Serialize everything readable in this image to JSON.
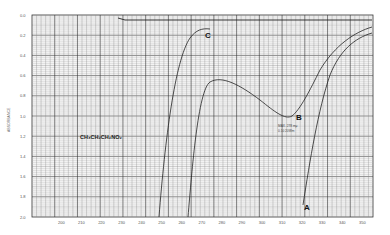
{
  "chart_data": {
    "type": "line",
    "title": "",
    "xlabel": "Wavelength (mμ)",
    "ylabel": "Absorbance",
    "y_axis_direction": "increasing downward",
    "xlim": [
      195,
      350
    ],
    "ylim": [
      0.0,
      2.0
    ],
    "grid": true,
    "y_ticks": [
      "0.0",
      "0.2",
      "0.4",
      "0.6",
      "0.8",
      "1.0",
      "1.2",
      "1.4",
      "1.6",
      "1.8",
      "2.0"
    ],
    "x_ticks": [
      "200",
      "210",
      "220",
      "230",
      "240",
      "250",
      "260",
      "270",
      "280",
      "290",
      "300",
      "310",
      "320",
      "330",
      "340",
      "350"
    ],
    "annotations": [
      {
        "text": "CH3CH2CH2NO2",
        "kind": "compound-formula"
      },
      {
        "text": "MAX. 278 mμ",
        "kind": "peak-note"
      },
      {
        "text": "0.10  ...",
        "kind": "peak-note"
      }
    ],
    "series": [
      {
        "name": "C",
        "points": [
          [
            230,
            2.0
          ],
          [
            233,
            1.2
          ],
          [
            236,
            0.6
          ],
          [
            240,
            0.2
          ],
          [
            244,
            0.1
          ]
        ]
      },
      {
        "name": "B",
        "points": [
          [
            245,
            2.0
          ],
          [
            247,
            1.2
          ],
          [
            250,
            0.75
          ],
          [
            255,
            0.6
          ],
          [
            265,
            0.75
          ],
          [
            272,
            0.95
          ],
          [
            278,
            1.0
          ],
          [
            285,
            0.85
          ],
          [
            295,
            0.5
          ],
          [
            310,
            0.25
          ],
          [
            330,
            0.1
          ],
          [
            345,
            0.05
          ]
        ]
      },
      {
        "name": "A",
        "points": [
          [
            284,
            2.0
          ],
          [
            288,
            1.4
          ],
          [
            292,
            0.8
          ],
          [
            300,
            0.45
          ],
          [
            315,
            0.25
          ],
          [
            330,
            0.15
          ],
          [
            345,
            0.1
          ]
        ]
      }
    ],
    "baseline": {
      "name": "baseline",
      "value": 0.02
    }
  },
  "labels": {
    "y_axis_title": "ABSORBANCE",
    "formula": "CH₃CH₂CH₂NO₂",
    "curve_a": "A",
    "curve_b": "B",
    "curve_c": "C",
    "peak_note_1": "MAX. 278 mμ",
    "peak_note_2": "0.10  20Wm"
  }
}
